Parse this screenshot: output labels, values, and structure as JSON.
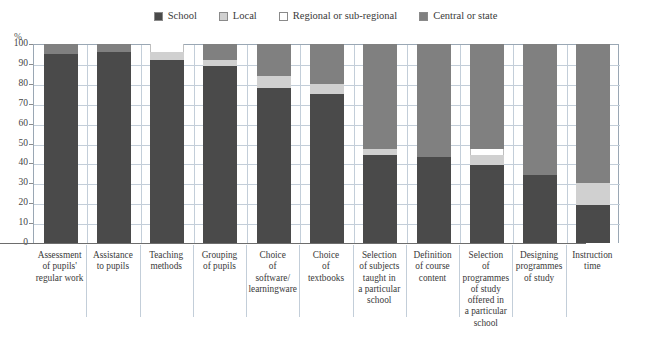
{
  "legend": {
    "items": [
      {
        "label": "School",
        "color": "#4a4a4a",
        "name": "legend-swatch-school"
      },
      {
        "label": "Local",
        "color": "#d0d0d0",
        "name": "legend-swatch-local"
      },
      {
        "label": "Regional or sub-regional",
        "color": "#ffffff",
        "name": "legend-swatch-regional"
      },
      {
        "label": "Central or state",
        "color": "#808080",
        "name": "legend-swatch-central"
      }
    ]
  },
  "axis": {
    "y_unit": "%",
    "y_ticks": [
      "100",
      "90",
      "80",
      "70",
      "60",
      "50",
      "40",
      "30",
      "20",
      "10",
      "0"
    ]
  },
  "chart_data": {
    "type": "bar",
    "title": "",
    "subtitle": "",
    "xlabel": "",
    "ylabel": "%",
    "ylim": [
      0,
      100
    ],
    "grid": true,
    "stacked": true,
    "legend_position": "top-center",
    "categories": [
      "Assessment of pupils' regular work",
      "Assistance to pupils",
      "Teaching methods",
      "Grouping of pupils",
      "Choice of software/ learningware",
      "Choice of textbooks",
      "Selection of subjects taught in a particular school",
      "Definition of course content",
      "Selection of programmes of study offered in a particular school",
      "Designing programmes of study",
      "Instruction time"
    ],
    "category_lines": [
      [
        "Assessment",
        "of pupils'",
        "regular work"
      ],
      [
        "Assistance",
        "to pupils"
      ],
      [
        "Teaching",
        "methods"
      ],
      [
        "Grouping",
        "of pupils"
      ],
      [
        "Choice",
        "of",
        "software/",
        "learningware"
      ],
      [
        "Choice",
        "of",
        "textbooks"
      ],
      [
        "Selection",
        "of subjects",
        "taught in",
        "a particular",
        "school"
      ],
      [
        "Definition",
        "of course",
        "content"
      ],
      [
        "Selection",
        "of",
        "programmes",
        "of study",
        "offered in",
        "a particular",
        "school"
      ],
      [
        "Designing",
        "programmes",
        "of study"
      ],
      [
        "Instruction",
        "time"
      ]
    ],
    "series": [
      {
        "name": "School",
        "color": "#4a4a4a",
        "values": [
          95,
          96,
          92,
          89,
          78,
          75,
          44,
          43,
          39,
          34,
          19
        ]
      },
      {
        "name": "Local",
        "color": "#d0d0d0",
        "values": [
          0,
          0,
          4,
          3,
          6,
          5,
          3,
          0,
          5,
          0,
          11
        ]
      },
      {
        "name": "Regional or sub-regional",
        "color": "#ffffff",
        "values": [
          0,
          0,
          4,
          0,
          0,
          0,
          0,
          0,
          3,
          0,
          0
        ]
      },
      {
        "name": "Central or state",
        "color": "#808080",
        "values": [
          5,
          4,
          0,
          8,
          16,
          20,
          53,
          57,
          53,
          66,
          70
        ]
      }
    ]
  }
}
